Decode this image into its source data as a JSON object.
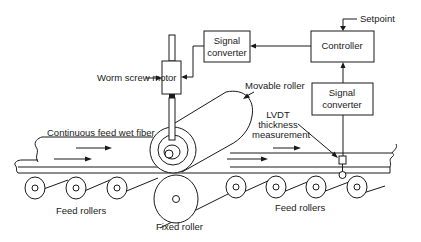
{
  "diagram": {
    "type": "process-control-schematic",
    "blocks": {
      "signal_converter_top": {
        "line1": "Signal",
        "line2": "converter"
      },
      "controller": {
        "label": "Controller"
      },
      "signal_converter_right": {
        "line1": "Signal",
        "line2": "converter"
      }
    },
    "labels": {
      "setpoint": "Setpoint",
      "worm_screw_motor": "Worm screw motor",
      "movable_roller": "Movable roller",
      "lvdt_line1": "LVDT",
      "lvdt_line2": "thickness",
      "lvdt_line3": "measurement",
      "continuous_feed": "Continuous feed wet fiber",
      "feed_rollers_left": "Feed rollers",
      "feed_rollers_right": "Feed rollers",
      "fixed_roller": "Fixed roller"
    },
    "connections": [
      {
        "from": "Setpoint",
        "to": "Controller"
      },
      {
        "from": "Controller",
        "to": "Signal converter (top)"
      },
      {
        "from": "Signal converter (top)",
        "to": "Worm screw motor"
      },
      {
        "from": "LVDT thickness measurement",
        "to": "Signal converter (right)"
      },
      {
        "from": "Signal converter (right)",
        "to": "Controller"
      }
    ],
    "colors": {
      "line": "#1a1a1a",
      "background": "#ffffff"
    }
  }
}
